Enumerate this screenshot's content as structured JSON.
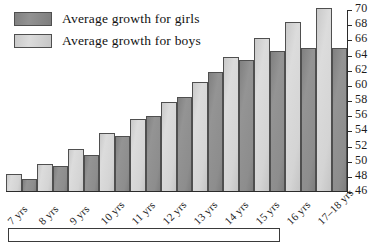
{
  "legend": {
    "position": "top-left",
    "entries": [
      {
        "key": "girls",
        "label": "Average growth for girls",
        "color": "#8a8a8a"
      },
      {
        "key": "boys",
        "label": "Average growth for boys",
        "color": "#d4d4d4"
      }
    ]
  },
  "axis": {
    "y_position": "right",
    "y_ticks": [
      70,
      68,
      66,
      64,
      62,
      60,
      58,
      56,
      54,
      52,
      50,
      48,
      46
    ]
  },
  "chart_data": {
    "type": "bar",
    "title": "",
    "xlabel": "",
    "ylabel": "",
    "ylim": [
      46,
      70
    ],
    "grid": false,
    "legend_position": "top-left",
    "bar_order": [
      "boys",
      "girls"
    ],
    "categories": [
      "7 yrs",
      "8 yrs",
      "9 yrs",
      "10 yrs",
      "11 yrs",
      "12 yrs",
      "13 yrs",
      "14 yrs",
      "15 yrs",
      "16 yrs",
      "17–18 yrs"
    ],
    "series": [
      {
        "name": "Average growth for boys",
        "color": "#d4d4d4",
        "values": [
          48.2,
          49.5,
          51.5,
          53.5,
          55.3,
          57.6,
          60.2,
          63.4,
          65.8,
          67.9,
          69.8
        ]
      },
      {
        "name": "Average growth for girls",
        "color": "#8a8a8a",
        "values": [
          47.6,
          49.2,
          50.7,
          53.1,
          55.7,
          58.2,
          61.5,
          63.0,
          64.2,
          64.5,
          64.6
        ]
      }
    ]
  }
}
